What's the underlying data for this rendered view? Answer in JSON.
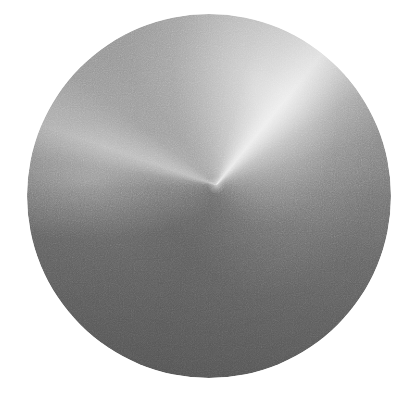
{
  "image": {
    "title": "Grayscale circular disc with angular (conic) brushed gradient",
    "subject": "disc",
    "background_color": "#ffffff",
    "width": 413,
    "height": 408,
    "color_mode": "grayscale",
    "texture": "film-grain noise",
    "alt_text": "A large light-to-dark gray circle filling most of a white square frame. A conic gradient sweeps around a convergence point slightly above and right of the circle's center, producing a bright wedge that flares toward the upper right and a broad dark region across the lower half."
  },
  "disc": {
    "name": "gradient-disc",
    "center_x": 209,
    "center_y": 196,
    "radius": 182,
    "diameter": 364,
    "left": 27,
    "top": 14,
    "convergence_point_x": 212,
    "convergence_point_y": 197,
    "highlight_direction": "upper-right",
    "shadow_direction": "lower-left",
    "colors": {
      "highlight": "#e6e6e6",
      "light_mid": "#c9c9c9",
      "mid": "#a9a9a9",
      "dark_mid": "#8a8a8a",
      "shadow": "#636363",
      "background": "#ffffff",
      "core": "#ffffff"
    },
    "gradient_type": "conic",
    "gradient_origin": "52% 47%"
  },
  "chart_data": {
    "type": "pie",
    "title": "Grayscale circular disc with angular (conic) brushed gradient",
    "subtitle": "Luminance sampled by angle around the convergence point",
    "xlabel": "Angle from 12 o'clock (degrees, clockwise)",
    "ylabel": "Luminance (0-255)",
    "ylim": [
      0,
      255
    ],
    "grid": false,
    "legend": "none",
    "categories": [
      "0",
      "14",
      "26",
      "34",
      "39",
      "46",
      "58",
      "74",
      "94",
      "118",
      "145",
      "172",
      "200",
      "228",
      "252",
      "268",
      "278",
      "284",
      "289",
      "296",
      "308",
      "322",
      "338",
      "352"
    ],
    "values": [
      169,
      180,
      201,
      220,
      230,
      210,
      171,
      142,
      123,
      111,
      105,
      101,
      99,
      102,
      107,
      115,
      138,
      165,
      182,
      174,
      157,
      154,
      158,
      164
    ],
    "annotations": [
      "Bright specular wedge peaks near 39 degrees (upper right)",
      "Darkest sector near 200 degrees (lower left to bottom)",
      "Secondary lighter lobe near 289 degrees (left of center)"
    ]
  }
}
